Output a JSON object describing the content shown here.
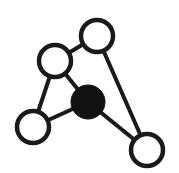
{
  "canvas": {
    "width": 179,
    "height": 173,
    "background": "#ffffff",
    "title": "Node-link graph diagram"
  },
  "style": {
    "edge_color": "#1a1a1a",
    "edge_width": 4,
    "node_stroke_color": "#1a1a1a",
    "node_stroke_width": 4.5,
    "node_fill_open": "#ffffff",
    "node_fill_solid": "#111111"
  },
  "chart_data": {
    "type": "diagram",
    "node_count": 5,
    "edge_count": 6,
    "nodes": [
      {
        "id": "A",
        "label": "top-right-node",
        "cx": 97,
        "cy": 36,
        "r": 16,
        "fill": "#ffffff",
        "filled": false,
        "degree": 2
      },
      {
        "id": "B",
        "label": "upper-left-node",
        "cx": 55,
        "cy": 61,
        "r": 16,
        "fill": "#ffffff",
        "filled": false,
        "degree": 3
      },
      {
        "id": "C",
        "label": "center-filled-node",
        "cx": 88,
        "cy": 102,
        "r": 17,
        "fill": "#111111",
        "filled": true,
        "degree": 3
      },
      {
        "id": "D",
        "label": "bottom-left-node",
        "cx": 33,
        "cy": 127,
        "r": 16,
        "fill": "#ffffff",
        "filled": false,
        "degree": 2
      },
      {
        "id": "E",
        "label": "bottom-right-node",
        "cx": 147,
        "cy": 150,
        "r": 16,
        "fill": "#ffffff",
        "filled": false,
        "degree": 2
      }
    ],
    "edges": [
      {
        "id": "A-B",
        "source": "A",
        "target": "B",
        "x1": 97,
        "y1": 36,
        "x2": 55,
        "y2": 61
      },
      {
        "id": "A-E",
        "source": "A",
        "target": "E",
        "x1": 97,
        "y1": 36,
        "x2": 147,
        "y2": 150
      },
      {
        "id": "B-C",
        "source": "B",
        "target": "C",
        "x1": 55,
        "y1": 61,
        "x2": 88,
        "y2": 102
      },
      {
        "id": "B-D",
        "source": "B",
        "target": "D",
        "x1": 55,
        "y1": 61,
        "x2": 33,
        "y2": 127
      },
      {
        "id": "C-D",
        "source": "C",
        "target": "D",
        "x1": 88,
        "y1": 102,
        "x2": 33,
        "y2": 127
      },
      {
        "id": "C-E",
        "source": "C",
        "target": "E",
        "x1": 88,
        "y1": 102,
        "x2": 147,
        "y2": 150
      }
    ]
  }
}
